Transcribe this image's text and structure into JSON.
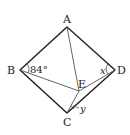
{
  "diagram": {
    "type": "geometry-figure",
    "points": {
      "A": {
        "label": "A",
        "x": 67,
        "y": 27
      },
      "B": {
        "label": "B",
        "x": 20,
        "y": 70
      },
      "C": {
        "label": "C",
        "x": 67,
        "y": 113
      },
      "D": {
        "label": "D",
        "x": 115,
        "y": 70
      },
      "E": {
        "label": "E",
        "x": 79,
        "y": 91
      }
    },
    "segments": [
      "AB",
      "AD",
      "BC",
      "CD",
      "AE",
      "BE",
      "ED",
      "EC"
    ],
    "angles": {
      "ABE": {
        "label": "84°"
      },
      "EDC_x": {
        "label": "x"
      },
      "ECD_y": {
        "label": "y"
      }
    },
    "colors": {
      "outline": "#222222",
      "inner": "#555555"
    }
  }
}
